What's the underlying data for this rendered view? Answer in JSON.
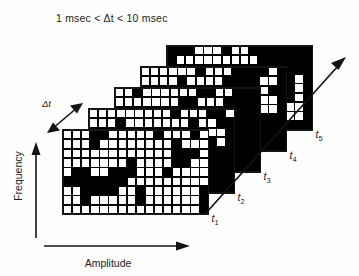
{
  "figure": {
    "caption": "1 msec < Δt < 10 msec",
    "caption_plain": "1 msec < Δt < 10 msec"
  },
  "axes": {
    "y_label": "Frequency",
    "x_label": "Amplitude",
    "depth_label": "Δt",
    "depth_ticks": [
      "t₁",
      "t₂",
      "t₃",
      "t₄",
      "t₅"
    ]
  },
  "colors": {
    "ink": "#141414",
    "cell_on": "#ffffff",
    "cell_off": "#000000",
    "background": "#fefefe"
  },
  "chart_data": {
    "type": "heatmap",
    "title": "1 msec < Δt < 10 msec",
    "xlabel": "Amplitude",
    "ylabel": "Frequency",
    "zlabel": "Δt",
    "grid": true,
    "legend": "none",
    "binary": true,
    "value_labels": {
      "1": "white cell (occupied)",
      "0": "black cell (empty)"
    },
    "panel_rows": 9,
    "panel_cols": 16,
    "panel_offset_x": 26,
    "panel_offset_y": -21,
    "panels": [
      {
        "name": "t₁",
        "tick": "t₁",
        "origin_x": 63,
        "origin_y": 130,
        "cells": [
          [
            1,
            1,
            1,
            0,
            0,
            1,
            1,
            1,
            1,
            1,
            0,
            1,
            1,
            1,
            0,
            1
          ],
          [
            1,
            1,
            1,
            0,
            1,
            1,
            1,
            1,
            1,
            1,
            1,
            1,
            0,
            1,
            1,
            1
          ],
          [
            1,
            1,
            1,
            1,
            1,
            1,
            1,
            1,
            1,
            1,
            1,
            1,
            0,
            0,
            0,
            1
          ],
          [
            1,
            1,
            1,
            1,
            1,
            1,
            1,
            0,
            1,
            1,
            1,
            1,
            0,
            0,
            1,
            1
          ],
          [
            1,
            0,
            0,
            1,
            1,
            0,
            0,
            0,
            1,
            1,
            1,
            0,
            1,
            1,
            1,
            1
          ],
          [
            0,
            0,
            0,
            0,
            0,
            0,
            0,
            1,
            1,
            1,
            1,
            1,
            1,
            1,
            1,
            1
          ],
          [
            1,
            1,
            0,
            0,
            0,
            0,
            1,
            1,
            0,
            1,
            1,
            1,
            1,
            1,
            1,
            0
          ],
          [
            1,
            1,
            0,
            1,
            1,
            1,
            1,
            1,
            0,
            1,
            1,
            1,
            1,
            1,
            1,
            0
          ],
          [
            1,
            1,
            1,
            1,
            1,
            1,
            1,
            1,
            1,
            1,
            1,
            1,
            1,
            1,
            1,
            0
          ]
        ]
      },
      {
        "name": "t₂",
        "tick": "t₂",
        "origin_x": 89,
        "origin_y": 109,
        "cells": [
          [
            1,
            1,
            1,
            1,
            1,
            1,
            1,
            1,
            1,
            0,
            1,
            1,
            1,
            0,
            0,
            1
          ],
          [
            1,
            1,
            1,
            0,
            1,
            1,
            1,
            1,
            1,
            1,
            1,
            0,
            1,
            1,
            0,
            0
          ],
          [
            1,
            1,
            1,
            1,
            1,
            1,
            1,
            1,
            1,
            1,
            0,
            0,
            0,
            1,
            1,
            0
          ],
          [
            1,
            1,
            1,
            1,
            1,
            1,
            1,
            1,
            1,
            1,
            1,
            1,
            0,
            0,
            1,
            0
          ],
          [
            1,
            0,
            1,
            1,
            1,
            1,
            1,
            0,
            1,
            1,
            1,
            1,
            1,
            0,
            0,
            0
          ],
          [
            0,
            0,
            1,
            1,
            1,
            1,
            1,
            1,
            1,
            1,
            1,
            1,
            1,
            0,
            0,
            0
          ],
          [
            1,
            1,
            1,
            1,
            0,
            0,
            1,
            1,
            1,
            1,
            1,
            1,
            0,
            0,
            0,
            0
          ],
          [
            1,
            1,
            1,
            1,
            1,
            1,
            1,
            1,
            1,
            1,
            0,
            0,
            0,
            0,
            0,
            0
          ],
          [
            1,
            1,
            1,
            1,
            1,
            1,
            1,
            1,
            0,
            0,
            0,
            0,
            0,
            0,
            0,
            0
          ]
        ]
      },
      {
        "name": "t₃",
        "tick": "t₃",
        "origin_x": 115,
        "origin_y": 88,
        "cells": [
          [
            1,
            1,
            0,
            1,
            1,
            1,
            1,
            1,
            1,
            0,
            0,
            1,
            1,
            0,
            0,
            0
          ],
          [
            1,
            1,
            1,
            1,
            1,
            1,
            1,
            0,
            0,
            1,
            1,
            1,
            0,
            0,
            0,
            0
          ],
          [
            1,
            0,
            0,
            1,
            1,
            1,
            1,
            1,
            1,
            1,
            0,
            1,
            1,
            0,
            0,
            0
          ],
          [
            1,
            1,
            1,
            1,
            1,
            1,
            1,
            1,
            1,
            1,
            1,
            0,
            0,
            0,
            0,
            0
          ],
          [
            1,
            1,
            1,
            1,
            0,
            1,
            1,
            1,
            1,
            1,
            0,
            0,
            0,
            0,
            0,
            0
          ],
          [
            1,
            1,
            1,
            1,
            1,
            1,
            1,
            0,
            1,
            1,
            0,
            0,
            0,
            0,
            0,
            0
          ],
          [
            1,
            1,
            1,
            1,
            1,
            1,
            1,
            1,
            1,
            0,
            0,
            0,
            0,
            0,
            0,
            0
          ],
          [
            1,
            1,
            0,
            1,
            1,
            1,
            1,
            1,
            0,
            0,
            0,
            0,
            0,
            0,
            0,
            0
          ],
          [
            1,
            1,
            1,
            1,
            1,
            1,
            0,
            0,
            0,
            0,
            0,
            0,
            0,
            0,
            0,
            0
          ]
        ]
      },
      {
        "name": "t₄",
        "tick": "t₄",
        "origin_x": 141,
        "origin_y": 67,
        "cells": [
          [
            1,
            1,
            1,
            1,
            1,
            1,
            0,
            1,
            1,
            1,
            0,
            0,
            0,
            0,
            1,
            0
          ],
          [
            1,
            1,
            1,
            1,
            0,
            1,
            1,
            1,
            1,
            0,
            0,
            0,
            0,
            1,
            1,
            0
          ],
          [
            1,
            1,
            1,
            1,
            1,
            1,
            1,
            1,
            0,
            0,
            0,
            0,
            0,
            1,
            0,
            0
          ],
          [
            1,
            1,
            1,
            1,
            1,
            1,
            1,
            0,
            0,
            0,
            0,
            0,
            0,
            1,
            1,
            0
          ],
          [
            1,
            1,
            1,
            1,
            1,
            0,
            1,
            0,
            0,
            0,
            0,
            0,
            0,
            1,
            1,
            0
          ],
          [
            1,
            1,
            1,
            1,
            0,
            0,
            0,
            0,
            0,
            0,
            0,
            0,
            0,
            0,
            0,
            0
          ],
          [
            1,
            1,
            1,
            0,
            0,
            0,
            0,
            0,
            0,
            0,
            0,
            0,
            0,
            0,
            0,
            0
          ],
          [
            1,
            1,
            0,
            0,
            0,
            0,
            0,
            0,
            0,
            0,
            0,
            0,
            0,
            0,
            0,
            0
          ],
          [
            1,
            0,
            0,
            0,
            0,
            0,
            0,
            0,
            0,
            0,
            0,
            0,
            0,
            0,
            0,
            0
          ]
        ]
      },
      {
        "name": "t₅",
        "tick": "t₅",
        "origin_x": 167,
        "origin_y": 46,
        "cells": [
          [
            0,
            0,
            0,
            1,
            1,
            1,
            0,
            1,
            1,
            0,
            0,
            0,
            0,
            0,
            0,
            0
          ],
          [
            0,
            1,
            1,
            1,
            1,
            1,
            1,
            1,
            1,
            1,
            0,
            0,
            0,
            0,
            0,
            0
          ],
          [
            0,
            1,
            1,
            0,
            1,
            1,
            1,
            1,
            0,
            0,
            0,
            0,
            0,
            0,
            0,
            0
          ],
          [
            1,
            1,
            1,
            1,
            0,
            1,
            1,
            1,
            1,
            1,
            0,
            0,
            0,
            0,
            1,
            0
          ],
          [
            0,
            1,
            1,
            1,
            1,
            1,
            0,
            0,
            1,
            0,
            0,
            0,
            0,
            0,
            1,
            0
          ],
          [
            0,
            1,
            1,
            1,
            1,
            0,
            0,
            0,
            0,
            0,
            0,
            0,
            0,
            0,
            1,
            0
          ],
          [
            0,
            1,
            1,
            0,
            0,
            0,
            0,
            0,
            0,
            0,
            0,
            0,
            0,
            1,
            1,
            0
          ],
          [
            0,
            0,
            0,
            0,
            0,
            0,
            0,
            0,
            0,
            0,
            0,
            0,
            0,
            1,
            1,
            0
          ],
          [
            0,
            0,
            0,
            0,
            0,
            0,
            0,
            0,
            0,
            0,
            0,
            0,
            0,
            0,
            0,
            0
          ]
        ]
      }
    ]
  }
}
